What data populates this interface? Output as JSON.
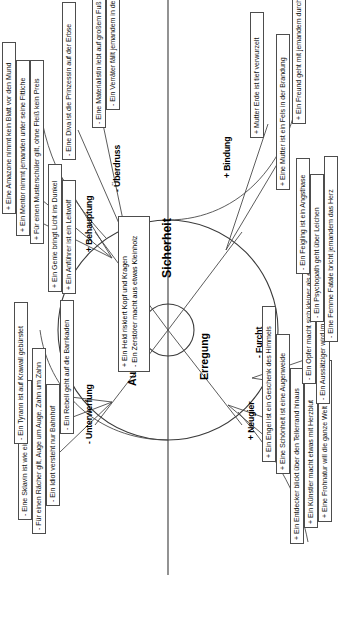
{
  "diagram": {
    "center": {
      "line1": "+ Ein Held riskiert Kopf und Kragen",
      "line2": "-  Ein Zerstörer macht aus etwas Kleinholz"
    },
    "axes": [
      {
        "key": "erregung",
        "label": "Erregung"
      },
      {
        "key": "autonomie",
        "label": "Autonomie"
      },
      {
        "key": "sicherheit",
        "label": "Sicherheit"
      }
    ],
    "sectors": [
      {
        "key": "unterwerfung",
        "label": "- Unterwerfung"
      },
      {
        "key": "behauptung",
        "label": "+ Behauptung"
      },
      {
        "key": "neugier",
        "label": "+ Neugier"
      },
      {
        "key": "ueberdruss",
        "label": "- Überdruss"
      },
      {
        "key": "furcht",
        "label": "- Furcht"
      },
      {
        "key": "bindung",
        "label": "+ Bindung"
      }
    ],
    "items": {
      "unterwerfung": [
        "- Eine Sklavin ist wie eine Marionette",
        "- Für einen Rächer gilt, Auge um Auge, Zahn um Zahn",
        "- Ein Idiot versteht nur Bahnhof",
        "- Ein Tyrann ist auf Krawall gebürstet",
        "- Ein Rebell geht auf die Barrikaden"
      ],
      "behauptung": [
        "+ Ein Anführer ist ein Leitwolf",
        "+ Ein Genie bringt Licht ins Dunkel",
        "+ Für einen Musterschüler gilt, ohne Fleiß kein Preis",
        "+ Ein Mentor nimmt jemanden unter seine Fittiche",
        "+ Eine Amazone nimmt kein Blatt vor den Mund"
      ],
      "neugier": [
        "+ Ein Entdecker blickt über den Tellerrand hinaus",
        "+ Ein Künstler macht etwas mit Herzblut",
        "+ Eine Frohnatur will die ganze Welt umarmen",
        "+ Eine Schönheit ist eine Augenweide",
        "+ Ein Engel ist ein Geschenk des Himmels"
      ],
      "furcht": [
        "- Ein Aussätziger wird im Stich gelassen",
        "- Ein Opfer macht sich kleiner als es ist",
        "- Eine Femme Fatale bricht jemandem das Herz",
        "- Ein Psychopath geht über Leichen",
        "- Ein Feigling ist ein Angsthase"
      ],
      "ueberdruss": [
        "- Eine Diva ist die Prinzessin auf der Erbse",
        "- Eine Materialistin lebt auf großem Fuß",
        "- Ein Verräter fällt jemandem in den Rücken"
      ],
      "bindung": [
        "+ Eine Mutter ist ein Fels in der Brandung",
        "+ Mutter Erde ist tief verwurzelt",
        "+ Ein Freund geht mit jemandem durch dick und dünn"
      ]
    }
  },
  "colors": {
    "stroke": "#4d4d4d",
    "text": "#111111",
    "background": "#ffffff"
  }
}
